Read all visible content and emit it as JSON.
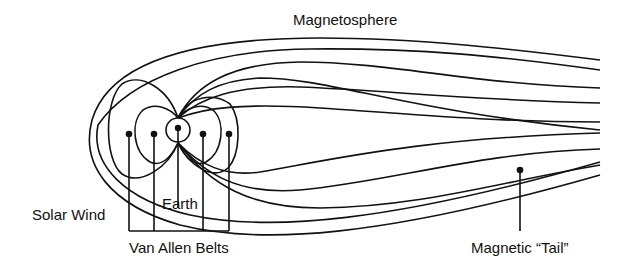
{
  "diagram": {
    "labels": {
      "magnetosphere": "Magnetosphere",
      "solar_wind": "Solar Wind",
      "earth": "Earth",
      "van_allen_belts": "Van Allen Belts",
      "magnetic_tail": "Magnetic “Tail”"
    },
    "colors": {
      "line": "#111111",
      "background": "#ffffff"
    }
  }
}
